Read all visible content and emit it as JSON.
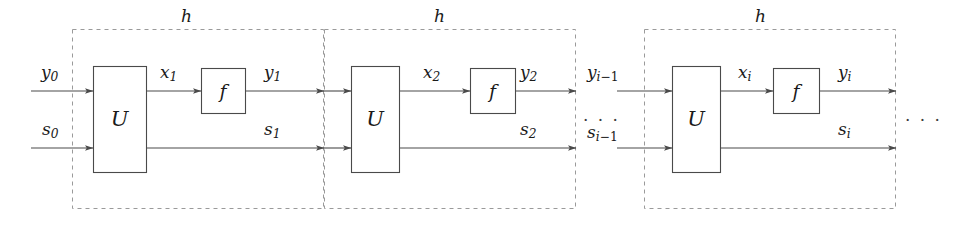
{
  "figure": {
    "canvas": {
      "width": 967,
      "height": 225
    },
    "colors": {
      "line": "#4a4a4a",
      "dashed": "#9a9a9a",
      "text": "#1a1a1a",
      "background": "#ffffff"
    }
  },
  "stages": [
    {
      "id": "stage-1",
      "group_label": "h",
      "u_block_label": "U",
      "f_block_label": "f",
      "input_top": {
        "base": "y",
        "sub": "0"
      },
      "input_bottom": {
        "base": "s",
        "sub": "0"
      },
      "intermediate": {
        "base": "x",
        "sub": "1"
      },
      "output_top": {
        "base": "y",
        "sub": "1"
      },
      "output_bottom": {
        "base": "s",
        "sub": "1"
      }
    },
    {
      "id": "stage-2",
      "group_label": "h",
      "u_block_label": "U",
      "f_block_label": "f",
      "input_top": {
        "base": "y",
        "sub": "1"
      },
      "input_bottom": {
        "base": "s",
        "sub": "1"
      },
      "intermediate": {
        "base": "x",
        "sub": "2"
      },
      "output_top": {
        "base": "y",
        "sub": "2"
      },
      "output_bottom": {
        "base": "s",
        "sub": "2"
      }
    },
    {
      "id": "stage-i",
      "group_label": "h",
      "u_block_label": "U",
      "f_block_label": "f",
      "input_top": {
        "base": "y",
        "sub": "i-1"
      },
      "input_bottom": {
        "base": "s",
        "sub": "i-1"
      },
      "intermediate": {
        "base": "x",
        "sub": "i"
      },
      "output_top": {
        "base": "y",
        "sub": "i"
      },
      "output_bottom": {
        "base": "s",
        "sub": "i"
      }
    }
  ],
  "labels": {
    "h_1": "h",
    "h_2": "h",
    "h_3": "h",
    "U_1": "U",
    "U_2": "U",
    "U_3": "U",
    "f_1": "f",
    "f_2": "f",
    "f_3": "f",
    "y0_base": "y",
    "y0_sub": "0",
    "s0_base": "s",
    "s0_sub": "0",
    "x1_base": "x",
    "x1_sub": "1",
    "y1_base": "y",
    "y1_sub": "1",
    "s1_base": "s",
    "s1_sub": "1",
    "x2_base": "x",
    "x2_sub": "2",
    "y2_base": "y",
    "y2_sub": "2",
    "s2_base": "s",
    "s2_sub": "2",
    "yim1_base": "y",
    "yim1_sub_var": "i",
    "yim1_sub_op": "−1",
    "sim1_base": "s",
    "sim1_sub_var": "i",
    "sim1_sub_op": "−1",
    "xi_base": "x",
    "xi_sub": "i",
    "yi_base": "y",
    "yi_sub": "i",
    "si_base": "s",
    "si_sub": "i",
    "ellipsis_left": "· · ·",
    "ellipsis_right": "· · ·"
  }
}
